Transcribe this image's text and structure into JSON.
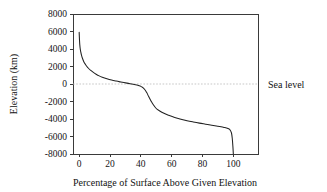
{
  "chart_data": {
    "type": "line",
    "title": "",
    "xlabel": "Percentage of Surface Above Given Elevation",
    "ylabel": "Elevation (km)",
    "xlim": [
      -4,
      116
    ],
    "ylim": [
      -8000,
      8000
    ],
    "grid": false,
    "legend": "none",
    "xticks": [
      0,
      20,
      40,
      60,
      80,
      100
    ],
    "xtick_labels": [
      "0",
      "20",
      "40",
      "60",
      "80",
      "100"
    ],
    "yticks": [
      8000,
      6000,
      4000,
      2000,
      0,
      -2000,
      -4000,
      -6000,
      -8000
    ],
    "ytick_labels": [
      "8000",
      "6000",
      "4000",
      "2000",
      "0",
      "-2000",
      "-4000",
      "-6000",
      "-8000"
    ],
    "annotations": [
      {
        "name": "sea-level",
        "text": "Sea level",
        "y": 0,
        "style": "dashed-horizontal-line-with-right-label"
      }
    ],
    "series": [
      {
        "name": "Hypsometric curve of Earth's solid surface",
        "x": [
          0.0,
          0.2,
          0.4,
          0.7,
          1.0,
          1.5,
          2.0,
          3.0,
          4.0,
          5.0,
          6.0,
          7.5,
          9.0,
          11.0,
          13.0,
          15.0,
          18.0,
          21.0,
          24.0,
          27.0,
          29.0,
          31.0,
          33.0,
          35.0,
          36.5,
          38.0,
          39.0,
          40.0,
          41.0,
          42.0,
          43.0,
          44.0,
          45.0,
          46.5,
          48.0,
          50.0,
          52.0,
          55.0,
          58.0,
          62.0,
          66.0,
          70.0,
          74.0,
          78.0,
          82.0,
          86.0,
          89.0,
          92.0,
          94.0,
          95.5,
          97.0,
          98.0,
          98.8,
          99.3,
          99.7,
          100.0
        ],
        "y": [
          5900,
          5100,
          4500,
          4000,
          3700,
          3300,
          3000,
          2550,
          2250,
          2000,
          1800,
          1550,
          1350,
          1120,
          930,
          780,
          600,
          450,
          330,
          225,
          160,
          100,
          40,
          -25,
          -80,
          -145,
          -200,
          -270,
          -370,
          -520,
          -740,
          -1040,
          -1400,
          -1900,
          -2350,
          -2800,
          -3050,
          -3350,
          -3570,
          -3830,
          -4030,
          -4200,
          -4340,
          -4470,
          -4590,
          -4710,
          -4800,
          -4890,
          -4960,
          -5020,
          -5120,
          -5280,
          -5600,
          -6200,
          -7100,
          -8000
        ]
      }
    ]
  },
  "axis": {
    "y_title": "Elevation (km)",
    "x_title": "Percentage of Surface Above Given Elevation"
  },
  "colors": {
    "curve": "#222222",
    "frame": "#3a3a3a",
    "sea_level": "#b9b9b9",
    "background": "#ffffff"
  }
}
